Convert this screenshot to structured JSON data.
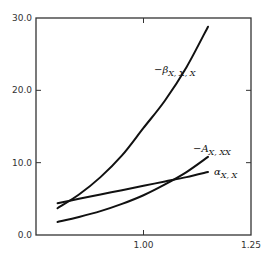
{
  "chart_data": {
    "type": "line",
    "title": "",
    "xlabel": "",
    "ylabel": "",
    "xlim": [
      0.75,
      1.25
    ],
    "ylim": [
      0,
      30
    ],
    "grid": false,
    "legend": "inline labels",
    "x_ticks": [
      {
        "value": 1.0,
        "label": "1.00"
      },
      {
        "value": 1.25,
        "label": "1.25"
      }
    ],
    "y_ticks": [
      {
        "value": 0,
        "label": "0.0"
      },
      {
        "value": 10,
        "label": "10.0"
      },
      {
        "value": 20,
        "label": "20.0"
      },
      {
        "value": 30,
        "label": "30.0"
      }
    ],
    "series": [
      {
        "name": "-β X,X,X",
        "label_main": "−β",
        "label_sub": "X, X, X",
        "x": [
          0.8,
          0.85,
          0.9,
          0.95,
          1.0,
          1.05,
          1.1,
          1.15
        ],
        "values": [
          3.7,
          5.6,
          8.0,
          11.0,
          14.8,
          18.6,
          23.2,
          28.8
        ]
      },
      {
        "name": "-A X,XX",
        "label_main": "−A",
        "label_sub": "X, XX",
        "x": [
          0.8,
          0.85,
          0.9,
          0.95,
          1.0,
          1.05,
          1.1,
          1.15
        ],
        "values": [
          1.8,
          2.5,
          3.3,
          4.3,
          5.5,
          7.0,
          8.7,
          10.8
        ]
      },
      {
        "name": "α X,X",
        "label_main": "α",
        "label_sub": "X, X",
        "x": [
          0.8,
          0.85,
          0.9,
          0.95,
          1.0,
          1.05,
          1.1,
          1.15
        ],
        "values": [
          4.4,
          5.0,
          5.6,
          6.2,
          6.8,
          7.4,
          8.0,
          8.7
        ]
      }
    ]
  },
  "colors": {
    "axis": "#333333",
    "curve": "#111111",
    "background": "#ffffff"
  }
}
